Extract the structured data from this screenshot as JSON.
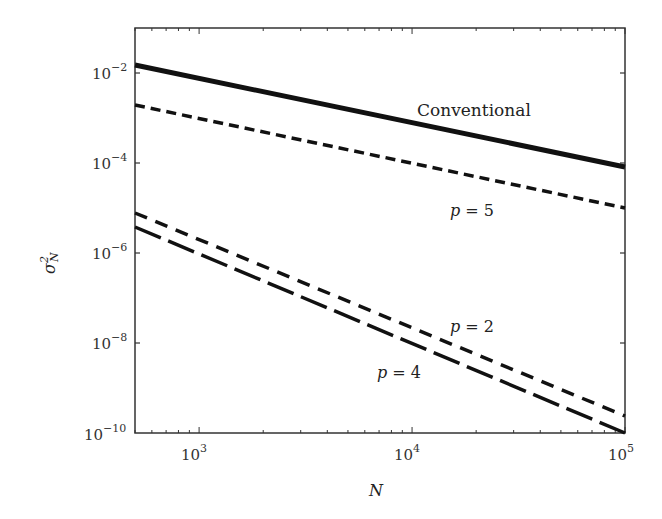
{
  "chart_data": {
    "type": "line",
    "title": "",
    "xlabel": "N",
    "ylabel": "σ²_N",
    "xscale": "log",
    "yscale": "log",
    "xlim": [
      500,
      100000
    ],
    "ylim": [
      1e-10,
      0.1
    ],
    "grid": false,
    "x_ticks": [
      {
        "value": 1000,
        "base": "10",
        "exp": "3"
      },
      {
        "value": 10000,
        "base": "10",
        "exp": "4"
      },
      {
        "value": 100000,
        "base": "10",
        "exp": "5"
      }
    ],
    "y_ticks": [
      {
        "value": 0.01,
        "base": "10",
        "exp": "−2"
      },
      {
        "value": 0.0001,
        "base": "10",
        "exp": "−4"
      },
      {
        "value": 1e-06,
        "base": "10",
        "exp": "−6"
      },
      {
        "value": 1e-08,
        "base": "10",
        "exp": "−8"
      },
      {
        "value": 1e-10,
        "base": "10",
        "exp": "−10"
      }
    ],
    "series": [
      {
        "name": "Conventional",
        "style": "solid",
        "x": [
          500,
          100000
        ],
        "values": [
          0.015,
          8e-05
        ]
      },
      {
        "name": "p = 5",
        "style": "short-dash",
        "x": [
          500,
          100000
        ],
        "values": [
          0.002,
          1e-05
        ]
      },
      {
        "name": "p = 2",
        "style": "short-dash",
        "x": [
          500,
          100000
        ],
        "values": [
          8e-06,
          2.5e-10
        ]
      },
      {
        "name": "p = 4",
        "style": "long-dash",
        "x": [
          500,
          100000
        ],
        "values": [
          4e-06,
          1e-10
        ]
      }
    ],
    "annotations": [
      {
        "text": "Conventional",
        "near_series": "Conventional"
      },
      {
        "text": "p = 5",
        "near_series": "p = 5"
      },
      {
        "text": "p = 2",
        "near_series": "p = 2"
      },
      {
        "text": "p = 4",
        "near_series": "p = 4"
      }
    ]
  },
  "labels": {
    "xlabel": "N",
    "ylabel_main": "σ",
    "ylabel_sup": "2",
    "ylabel_sub": "N",
    "conventional": "Conventional",
    "p5_var": "p",
    "p5_rest": " = 5",
    "p2_var": "p",
    "p2_rest": " = 2",
    "p4_var": "p",
    "p4_rest": " = 4"
  },
  "ticks": {
    "x": [
      {
        "base": "10",
        "exp": "3"
      },
      {
        "base": "10",
        "exp": "4"
      },
      {
        "base": "10",
        "exp": "5"
      }
    ],
    "y": [
      {
        "base": "10",
        "exp": "−2"
      },
      {
        "base": "10",
        "exp": "−4"
      },
      {
        "base": "10",
        "exp": "−6"
      },
      {
        "base": "10",
        "exp": "−8"
      },
      {
        "base": "10",
        "exp": "−10"
      }
    ]
  }
}
